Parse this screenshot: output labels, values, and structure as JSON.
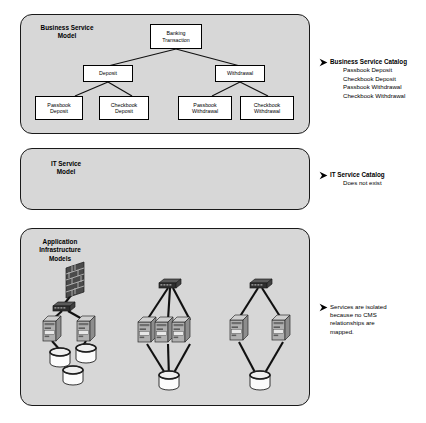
{
  "diagram": {
    "panels": [
      {
        "id": "business-service-model",
        "label": "Business Service\nModel"
      },
      {
        "id": "it-service-model",
        "label": "IT Service\nModel"
      },
      {
        "id": "application-infrastructure-models",
        "label": "Application\nInfrastructure\nModels"
      }
    ],
    "business_tree": {
      "root": {
        "id": "banking-transaction",
        "label": "Banking\nTransaction"
      },
      "level2": [
        {
          "id": "deposit",
          "label": "Deposit"
        },
        {
          "id": "withdrawal",
          "label": "Withdrawal"
        }
      ],
      "level3": [
        {
          "id": "passbook-deposit",
          "label": "Passbook\nDeposit"
        },
        {
          "id": "checkbook-deposit",
          "label": "Checkbook\nDeposit"
        },
        {
          "id": "passbook-withdrawal",
          "label": "Passbook\nWithdrawal"
        },
        {
          "id": "checkbook-withdrawal",
          "label": "Checkbook\nWithdrawal"
        }
      ]
    },
    "callouts": [
      {
        "id": "business-service-catalog",
        "heading": "Business Service Catalog",
        "items": "Passbook Deposit\nCheckbook Deposit\nPassbook Withdrawal\nCheckbook Withdrawal"
      },
      {
        "id": "it-service-catalog",
        "heading": "IT Service Catalog",
        "items": "Does not exist"
      },
      {
        "id": "isolated-services-note",
        "heading": "",
        "items": "Services are isolated\nbecause no CMS\nrelationships are\nmapped."
      }
    ],
    "infrastructure_clusters": [
      {
        "id": "cluster-1",
        "nodes": {
          "firewall": 1,
          "switch": 1,
          "servers": 2,
          "databases": 3
        }
      },
      {
        "id": "cluster-2",
        "nodes": {
          "firewall": 0,
          "switch": 1,
          "servers": 3,
          "databases": 1
        }
      },
      {
        "id": "cluster-3",
        "nodes": {
          "firewall": 0,
          "switch": 1,
          "servers": 2,
          "databases": 1
        }
      }
    ],
    "colors": {
      "panel_fill": "#d7d7d7",
      "panel_border": "#1a1a1a",
      "node_fill": "#ffffff",
      "node_border": "#000000",
      "connector": "#111111",
      "device_body": "#a8a8a8",
      "device_dark": "#3a3a3a",
      "db_fill": "#fdfdfd",
      "text": "#000000"
    }
  }
}
